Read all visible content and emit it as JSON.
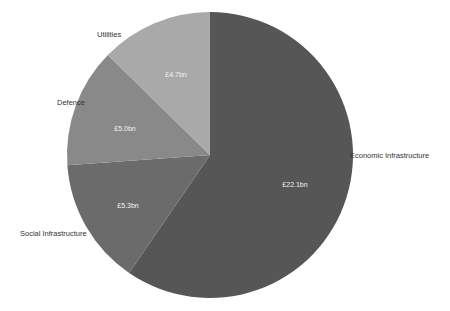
{
  "chart_data": {
    "type": "pie",
    "title": "",
    "start_angle_deg": 0,
    "direction": "clockwise",
    "unit": "£bn",
    "categories": [
      "Economic Infrastructure",
      "Social Infrastructure",
      "Defence",
      "Utilities"
    ],
    "values": [
      22.1,
      5.3,
      5.0,
      4.7
    ],
    "value_labels": [
      "£22.1bn",
      "£5.3bn",
      "£5.0bn",
      "£4.7bn"
    ],
    "colors": [
      "#565656",
      "#6b6b6b",
      "#898989",
      "#a9a9a9"
    ],
    "legend": "none (labels placed outside slices)"
  },
  "labels": {
    "economic": "Economic Infrastructure",
    "social": "Social Infrastructure",
    "defence": "Defence",
    "utilities": "Utilities",
    "economic_value": "£22.1bn",
    "social_value": "£5.3bn",
    "defence_value": "£5.0bn",
    "utilities_value": "£4.7bn"
  }
}
